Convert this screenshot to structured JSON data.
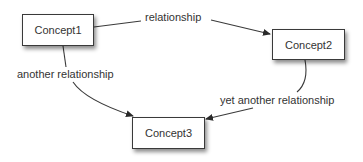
{
  "diagram": {
    "type": "concept-map",
    "nodes": [
      {
        "id": "c1",
        "label": "Concept1"
      },
      {
        "id": "c2",
        "label": "Concept2"
      },
      {
        "id": "c3",
        "label": "Concept3"
      }
    ],
    "edges": [
      {
        "from": "c1",
        "to": "c2",
        "label": "relationship"
      },
      {
        "from": "c1",
        "to": "c3",
        "label": "another relationship"
      },
      {
        "from": "c2",
        "to": "c3",
        "label": "yet another relationship"
      }
    ]
  },
  "colors": {
    "background": "#ffffff",
    "stroke": "#3a3a3a",
    "text": "#333333"
  }
}
